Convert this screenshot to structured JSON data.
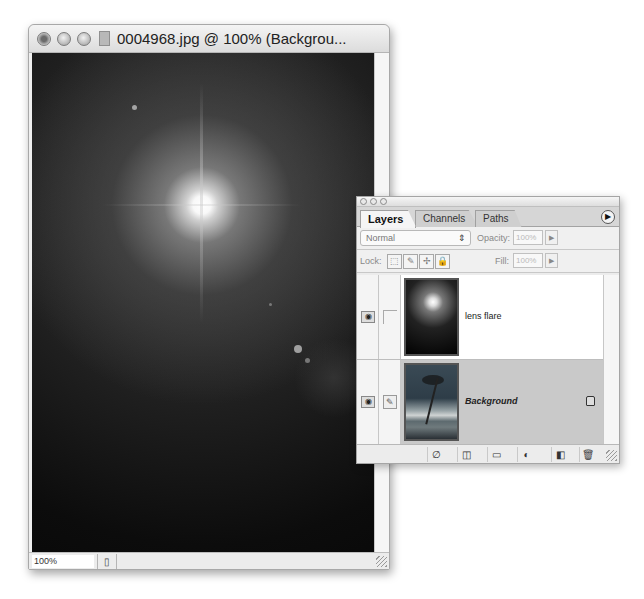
{
  "document_window": {
    "title": "0004968.jpg @ 100% (Backgrou...",
    "zoom_level": "100%",
    "buttons": {
      "close": "close",
      "minimize": "minimize",
      "zoom": "zoom"
    },
    "status_button_icon": "▯"
  },
  "layers_palette": {
    "tabs": [
      {
        "label": "Layers",
        "active": true
      },
      {
        "label": "Channels",
        "active": false
      },
      {
        "label": "Paths",
        "active": false
      }
    ],
    "menu_icon": "▶",
    "blend_mode": "Normal",
    "blend_arrow": "⇕",
    "opacity_label": "Opacity:",
    "opacity_value": "100%",
    "fill_label": "Fill:",
    "fill_value": "100%",
    "stepper_icon": "▶",
    "lock_label": "Lock:",
    "lock_buttons": [
      "⬚",
      "✎",
      "✢",
      "🔒"
    ],
    "layers": [
      {
        "name": "lens flare",
        "visible": true,
        "selected": false,
        "locked": false
      },
      {
        "name": "Background",
        "visible": true,
        "selected": true,
        "locked": true
      }
    ],
    "eye_icon": "◉",
    "brush_icon": "✎",
    "toolbar_icons": [
      "∅",
      "◫",
      "▭",
      "◐",
      "◧",
      "🗑"
    ]
  }
}
